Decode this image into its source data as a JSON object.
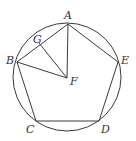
{
  "diagram": {
    "type": "geometry",
    "circle": {
      "cx": 67,
      "cy": 77,
      "r": 54
    },
    "points": {
      "A": {
        "x": 68,
        "y": 24,
        "label": "A"
      },
      "B": {
        "x": 17,
        "y": 62,
        "label": "B"
      },
      "C": {
        "x": 36,
        "y": 121,
        "label": "C"
      },
      "D": {
        "x": 99,
        "y": 121,
        "label": "D"
      },
      "E": {
        "x": 118,
        "y": 62,
        "label": "E"
      },
      "F": {
        "x": 67,
        "y": 78,
        "label": "F"
      },
      "G": {
        "x": 39,
        "y": 43,
        "label": "G"
      }
    },
    "segments": [
      "AB",
      "BC",
      "CD",
      "DE",
      "EA",
      "AF",
      "BF",
      "GF"
    ]
  }
}
